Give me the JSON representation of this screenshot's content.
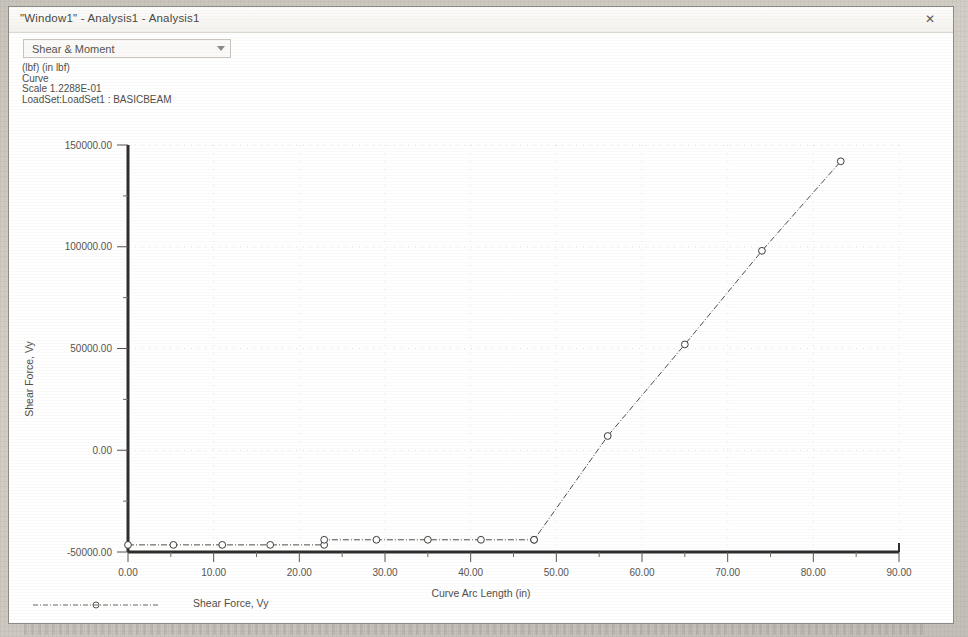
{
  "window": {
    "title": "\"Window1\" - Analysis1 - Analysis1",
    "close_icon": "close-icon",
    "close_glyph": "✕"
  },
  "toolbar": {
    "plot_type_select": {
      "value": "Shear & Moment",
      "icon": "chevron-down-icon"
    }
  },
  "info": {
    "units": "(lbf) (in lbf)",
    "entity": "Curve",
    "scale": "Scale  1.2288E-01",
    "loadset": "LoadSet:LoadSet1 :  BASICBEAM"
  },
  "legend": {
    "series_label": "Shear Force, Vy",
    "marker": "circle-marker"
  },
  "chart_data": {
    "type": "line",
    "title": "",
    "xlabel": "Curve Arc Length (in)",
    "ylabel": "Shear Force, Vy",
    "xlim": [
      0,
      90
    ],
    "ylim": [
      -50000,
      150000
    ],
    "xticks": [
      0,
      10,
      20,
      30,
      40,
      50,
      60,
      70,
      80,
      90
    ],
    "xtick_labels": [
      "0.00",
      "10.00",
      "20.00",
      "30.00",
      "40.00",
      "50.00",
      "60.00",
      "70.00",
      "80.00",
      "90.00"
    ],
    "yticks": [
      -50000,
      0,
      50000,
      100000,
      150000
    ],
    "ytick_labels": [
      "-50000.00",
      "0.00",
      "50000.00",
      "100000.00",
      "150000.00"
    ],
    "minor_yticks": [
      -25000,
      25000,
      75000,
      125000
    ],
    "grid": false,
    "legend_position": "bottom-left",
    "series": [
      {
        "name": "Shear Force, Vy",
        "marker": "open-circle",
        "linestyle": "dash-dot",
        "x": [
          0.0,
          5.3,
          11.0,
          16.6,
          22.9,
          22.9,
          29.0,
          35.0,
          41.2,
          47.4,
          47.4,
          56.0,
          65.0,
          74.0,
          83.2
        ],
        "y": [
          -46500,
          -46500,
          -46500,
          -46500,
          -46500,
          -44000,
          -44000,
          -44000,
          -44000,
          -44000,
          -44000,
          7000,
          52000,
          98000,
          142000
        ]
      }
    ]
  }
}
